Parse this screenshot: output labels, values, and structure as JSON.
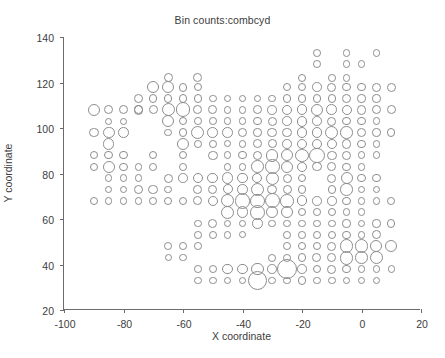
{
  "chart_data": {
    "type": "scatter",
    "title": "Bin counts:combcyd",
    "xlabel": "X coordinate",
    "ylabel": "Y coordinate",
    "xlim": [
      -100,
      20
    ],
    "ylim": [
      20,
      140
    ],
    "xticks": [
      -100,
      -80,
      -60,
      -40,
      -20,
      0,
      20
    ],
    "xticklabels": [
      "-100",
      "-80",
      "-60",
      "-40",
      "-20",
      "0",
      "20"
    ],
    "yticks": [
      20,
      40,
      60,
      80,
      100,
      120,
      140
    ],
    "yticklabels": [
      "20",
      "40",
      "60",
      "80",
      "100",
      "120",
      "140"
    ],
    "grid": false,
    "legend": null,
    "marker": "open-circle",
    "marker_color": "#8d8d8d",
    "encoding": "bubble size encodes bin count",
    "size_units": "marker diameter in data-x units (5 = grid pitch)",
    "points": [
      [
        -90,
        108,
        4.0
      ],
      [
        -85,
        108,
        3.0
      ],
      [
        -80,
        108,
        3.0
      ],
      [
        -75,
        108,
        3.2
      ],
      [
        -70,
        108,
        3.0
      ],
      [
        -65,
        108,
        4.4
      ],
      [
        -60,
        108,
        5.0
      ],
      [
        -55,
        108,
        3.0
      ],
      [
        -50,
        108,
        3.0
      ],
      [
        -45,
        108,
        2.6
      ],
      [
        -40,
        108,
        2.6
      ],
      [
        -35,
        108,
        3.0
      ],
      [
        -30,
        108,
        3.2
      ],
      [
        -25,
        108,
        3.4
      ],
      [
        -20,
        108,
        3.6
      ],
      [
        -15,
        108,
        4.2
      ],
      [
        -10,
        108,
        3.6
      ],
      [
        -5,
        108,
        3.4
      ],
      [
        0,
        108,
        3.2
      ],
      [
        5,
        108,
        3.0
      ],
      [
        10,
        108,
        3.0
      ],
      [
        -90,
        98,
        3.2
      ],
      [
        -85,
        98,
        4.0
      ],
      [
        -80,
        98,
        3.6
      ],
      [
        -65,
        98,
        2.6
      ],
      [
        -60,
        98,
        2.8
      ],
      [
        -55,
        98,
        4.4
      ],
      [
        -50,
        98,
        3.6
      ],
      [
        -45,
        98,
        3.6
      ],
      [
        -40,
        98,
        3.0
      ],
      [
        -35,
        98,
        2.8
      ],
      [
        -30,
        98,
        3.2
      ],
      [
        -25,
        98,
        3.2
      ],
      [
        -20,
        98,
        3.4
      ],
      [
        -15,
        98,
        3.6
      ],
      [
        -10,
        98,
        4.4
      ],
      [
        -5,
        98,
        4.2
      ],
      [
        0,
        98,
        3.0
      ],
      [
        5,
        98,
        2.8
      ],
      [
        10,
        98,
        2.8
      ],
      [
        -85,
        93,
        3.8
      ],
      [
        -60,
        93,
        4.0
      ],
      [
        -55,
        93,
        2.6
      ],
      [
        -50,
        93,
        2.6
      ],
      [
        -45,
        93,
        2.4
      ],
      [
        -40,
        93,
        2.6
      ],
      [
        -35,
        93,
        3.0
      ],
      [
        -30,
        93,
        3.0
      ],
      [
        -25,
        93,
        3.2
      ],
      [
        -20,
        93,
        3.6
      ],
      [
        -15,
        93,
        3.4
      ],
      [
        -10,
        93,
        3.4
      ],
      [
        -5,
        93,
        3.2
      ],
      [
        0,
        93,
        2.8
      ],
      [
        5,
        93,
        2.6
      ],
      [
        -90,
        88,
        2.8
      ],
      [
        -85,
        88,
        2.8
      ],
      [
        -80,
        88,
        2.8
      ],
      [
        -70,
        88,
        2.8
      ],
      [
        -60,
        88,
        2.8
      ],
      [
        -50,
        88,
        3.2
      ],
      [
        -45,
        88,
        2.6
      ],
      [
        -40,
        88,
        2.8
      ],
      [
        -35,
        88,
        3.2
      ],
      [
        -30,
        88,
        4.2
      ],
      [
        -25,
        88,
        4.0
      ],
      [
        -20,
        88,
        4.4
      ],
      [
        -15,
        88,
        5.2
      ],
      [
        -10,
        88,
        3.2
      ],
      [
        -5,
        88,
        3.0
      ],
      [
        0,
        88,
        2.6
      ],
      [
        5,
        88,
        2.6
      ],
      [
        -90,
        83,
        2.8
      ],
      [
        -85,
        83,
        4.0
      ],
      [
        -80,
        83,
        2.8
      ],
      [
        -75,
        83,
        2.6
      ],
      [
        -70,
        83,
        2.6
      ],
      [
        -60,
        83,
        2.6
      ],
      [
        -45,
        83,
        2.6
      ],
      [
        -40,
        83,
        2.6
      ],
      [
        -35,
        83,
        4.2
      ],
      [
        -30,
        83,
        5.0
      ],
      [
        -25,
        83,
        4.0
      ],
      [
        -20,
        83,
        3.4
      ],
      [
        -15,
        83,
        3.2
      ],
      [
        -10,
        83,
        3.0
      ],
      [
        -5,
        83,
        2.8
      ],
      [
        0,
        83,
        2.6
      ],
      [
        -85,
        78,
        2.6
      ],
      [
        -80,
        78,
        2.6
      ],
      [
        -75,
        78,
        2.6
      ],
      [
        -65,
        78,
        3.0
      ],
      [
        -60,
        78,
        3.2
      ],
      [
        -55,
        78,
        3.6
      ],
      [
        -50,
        78,
        3.6
      ],
      [
        -45,
        78,
        3.8
      ],
      [
        -40,
        78,
        3.6
      ],
      [
        -35,
        78,
        3.4
      ],
      [
        -30,
        78,
        4.4
      ],
      [
        -25,
        78,
        3.0
      ],
      [
        -20,
        78,
        2.8
      ],
      [
        -10,
        78,
        3.0
      ],
      [
        -5,
        78,
        4.0
      ],
      [
        0,
        78,
        2.8
      ],
      [
        5,
        78,
        2.8
      ],
      [
        -85,
        73,
        2.6
      ],
      [
        -80,
        73,
        2.6
      ],
      [
        -75,
        73,
        3.2
      ],
      [
        -70,
        73,
        3.2
      ],
      [
        -65,
        73,
        2.6
      ],
      [
        -55,
        73,
        3.0
      ],
      [
        -50,
        73,
        3.0
      ],
      [
        -45,
        73,
        3.4
      ],
      [
        -40,
        73,
        3.8
      ],
      [
        -35,
        73,
        4.4
      ],
      [
        -30,
        73,
        3.2
      ],
      [
        -25,
        73,
        3.0
      ],
      [
        -20,
        73,
        2.8
      ],
      [
        -10,
        73,
        2.8
      ],
      [
        -5,
        73,
        4.2
      ],
      [
        0,
        73,
        2.6
      ],
      [
        5,
        73,
        2.6
      ],
      [
        -90,
        68,
        2.8
      ],
      [
        -85,
        68,
        2.6
      ],
      [
        -80,
        68,
        2.6
      ],
      [
        -75,
        68,
        2.6
      ],
      [
        -70,
        68,
        2.6
      ],
      [
        -65,
        68,
        2.8
      ],
      [
        -60,
        68,
        2.8
      ],
      [
        -55,
        68,
        3.0
      ],
      [
        -50,
        68,
        3.4
      ],
      [
        -45,
        68,
        4.4
      ],
      [
        -40,
        68,
        5.2
      ],
      [
        -35,
        68,
        4.8
      ],
      [
        -30,
        68,
        5.0
      ],
      [
        -25,
        68,
        4.6
      ],
      [
        -20,
        68,
        3.6
      ],
      [
        -15,
        68,
        3.2
      ],
      [
        -10,
        68,
        3.2
      ],
      [
        -5,
        68,
        2.8
      ],
      [
        0,
        68,
        2.6
      ],
      [
        5,
        68,
        2.6
      ],
      [
        10,
        68,
        2.6
      ],
      [
        -45,
        63,
        4.4
      ],
      [
        -40,
        63,
        4.0
      ],
      [
        -35,
        63,
        5.0
      ],
      [
        -30,
        63,
        4.0
      ],
      [
        -25,
        63,
        4.2
      ],
      [
        -20,
        63,
        2.8
      ],
      [
        -15,
        63,
        2.6
      ],
      [
        -10,
        63,
        2.8
      ],
      [
        -5,
        63,
        2.6
      ],
      [
        0,
        63,
        2.6
      ],
      [
        -55,
        58,
        2.6
      ],
      [
        -50,
        58,
        3.0
      ],
      [
        -45,
        58,
        2.6
      ],
      [
        -40,
        58,
        2.6
      ],
      [
        -35,
        58,
        3.6
      ],
      [
        -30,
        58,
        2.6
      ],
      [
        -25,
        58,
        2.6
      ],
      [
        -20,
        58,
        2.6
      ],
      [
        -15,
        58,
        2.6
      ],
      [
        -10,
        58,
        2.6
      ],
      [
        -5,
        58,
        2.8
      ],
      [
        0,
        58,
        2.6
      ],
      [
        5,
        58,
        2.8
      ],
      [
        10,
        58,
        2.8
      ],
      [
        -55,
        53,
        2.6
      ],
      [
        -50,
        53,
        2.6
      ],
      [
        -45,
        53,
        2.6
      ],
      [
        -40,
        53,
        2.4
      ],
      [
        -25,
        53,
        2.6
      ],
      [
        -20,
        53,
        2.6
      ],
      [
        -15,
        53,
        2.6
      ],
      [
        -10,
        53,
        2.8
      ],
      [
        -5,
        53,
        2.8
      ],
      [
        0,
        53,
        2.6
      ],
      [
        5,
        53,
        3.0
      ],
      [
        -65,
        48,
        2.6
      ],
      [
        -60,
        48,
        2.6
      ],
      [
        -55,
        48,
        2.6
      ],
      [
        -25,
        48,
        2.6
      ],
      [
        -20,
        48,
        2.8
      ],
      [
        -15,
        48,
        2.8
      ],
      [
        -10,
        48,
        3.0
      ],
      [
        -5,
        48,
        4.6
      ],
      [
        0,
        48,
        4.6
      ],
      [
        5,
        48,
        4.0
      ],
      [
        10,
        48,
        4.0
      ],
      [
        -65,
        43,
        2.4
      ],
      [
        -60,
        43,
        2.4
      ],
      [
        -30,
        43,
        2.6
      ],
      [
        -25,
        43,
        2.6
      ],
      [
        -20,
        43,
        3.0
      ],
      [
        -15,
        43,
        3.0
      ],
      [
        -10,
        43,
        3.0
      ],
      [
        -5,
        43,
        4.6
      ],
      [
        0,
        43,
        4.2
      ],
      [
        5,
        43,
        4.4
      ],
      [
        -55,
        38,
        2.6
      ],
      [
        -50,
        38,
        2.6
      ],
      [
        -45,
        38,
        3.6
      ],
      [
        -40,
        38,
        3.4
      ],
      [
        -35,
        38,
        4.2
      ],
      [
        -30,
        38,
        3.2
      ],
      [
        -25,
        38,
        6.8
      ],
      [
        -20,
        38,
        3.2
      ],
      [
        -15,
        38,
        2.8
      ],
      [
        -10,
        38,
        3.0
      ],
      [
        -5,
        38,
        2.8
      ],
      [
        0,
        38,
        2.6
      ],
      [
        5,
        38,
        2.6
      ],
      [
        10,
        38,
        2.4
      ],
      [
        -55,
        33,
        2.6
      ],
      [
        -50,
        33,
        2.6
      ],
      [
        -45,
        33,
        2.6
      ],
      [
        -40,
        33,
        2.6
      ],
      [
        -35,
        33,
        6.4
      ],
      [
        -30,
        33,
        2.6
      ],
      [
        -25,
        33,
        2.6
      ],
      [
        -20,
        33,
        2.8
      ],
      [
        -15,
        33,
        2.6
      ],
      [
        -10,
        33,
        2.6
      ],
      [
        -5,
        33,
        2.6
      ],
      [
        0,
        33,
        2.4
      ],
      [
        5,
        33,
        2.4
      ],
      [
        -65,
        118,
        4.0
      ],
      [
        -60,
        118,
        3.0
      ],
      [
        -55,
        118,
        2.8
      ],
      [
        -25,
        118,
        2.8
      ],
      [
        -20,
        118,
        2.8
      ],
      [
        -15,
        118,
        3.2
      ],
      [
        -10,
        118,
        3.0
      ],
      [
        -5,
        118,
        2.8
      ],
      [
        0,
        118,
        2.8
      ],
      [
        5,
        118,
        3.0
      ],
      [
        10,
        118,
        3.0
      ],
      [
        -75,
        113,
        3.0
      ],
      [
        -70,
        113,
        2.8
      ],
      [
        -65,
        113,
        2.8
      ],
      [
        -60,
        113,
        2.8
      ],
      [
        -55,
        113,
        2.8
      ],
      [
        -50,
        113,
        2.6
      ],
      [
        -45,
        113,
        2.6
      ],
      [
        -40,
        113,
        2.6
      ],
      [
        -35,
        113,
        2.6
      ],
      [
        -30,
        113,
        2.6
      ],
      [
        -25,
        113,
        2.8
      ],
      [
        -20,
        113,
        2.8
      ],
      [
        -15,
        113,
        2.8
      ],
      [
        -10,
        113,
        2.8
      ],
      [
        -5,
        113,
        3.0
      ],
      [
        0,
        113,
        2.8
      ],
      [
        5,
        113,
        2.8
      ],
      [
        -65,
        122,
        3.0
      ],
      [
        -55,
        122,
        3.0
      ],
      [
        -20,
        122,
        2.8
      ],
      [
        -10,
        122,
        2.6
      ],
      [
        -5,
        122,
        2.6
      ],
      [
        -15,
        128,
        2.6
      ],
      [
        -5,
        128,
        2.6
      ],
      [
        0,
        128,
        2.6
      ],
      [
        -15,
        133,
        2.6
      ],
      [
        -5,
        133,
        2.6
      ],
      [
        5,
        133,
        2.6
      ],
      [
        -60,
        103,
        2.8
      ],
      [
        -65,
        103,
        4.2
      ],
      [
        -55,
        103,
        2.6
      ],
      [
        -50,
        103,
        2.6
      ],
      [
        -45,
        103,
        2.6
      ],
      [
        -40,
        103,
        2.6
      ],
      [
        -35,
        103,
        2.8
      ],
      [
        -30,
        103,
        3.0
      ],
      [
        -25,
        103,
        3.2
      ],
      [
        -20,
        103,
        3.6
      ],
      [
        -15,
        103,
        3.2
      ],
      [
        -10,
        103,
        3.0
      ],
      [
        -5,
        103,
        2.8
      ],
      [
        0,
        103,
        2.8
      ],
      [
        5,
        103,
        2.6
      ],
      [
        -70,
        118,
        4.2
      ],
      [
        -75,
        108,
        3.0
      ],
      [
        -80,
        103,
        2.4
      ],
      [
        -85,
        103,
        2.4
      ]
    ]
  },
  "axis": {
    "x_title": "X coordinate",
    "y_title": "Y coordinate"
  }
}
